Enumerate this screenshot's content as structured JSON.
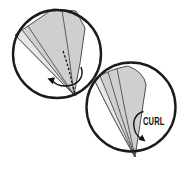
{
  "labels": {
    "curl": "CURL"
  },
  "colors": {
    "background": "#ffffff",
    "inset_fill": "#ffffff",
    "inset_stroke": "#1b1b1b",
    "blade_fill": "#cfcfcf",
    "blade_highlight_fill": "#e7e7e7",
    "blade_stroke": "#4d4d4d",
    "annotation": "#101010"
  }
}
